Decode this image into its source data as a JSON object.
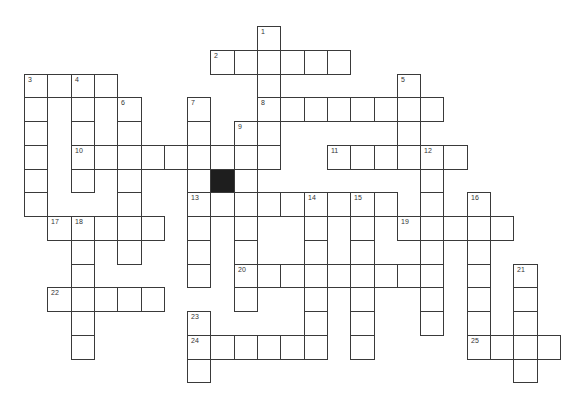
{
  "puzzle": {
    "grid": {
      "origin_x": 24,
      "origin_y": 26,
      "pitch_x": 23.3,
      "pitch_y": 23.75,
      "colors": {
        "line": "#3a3a3a",
        "fill": "#ffffff",
        "block": "#1e1e1e"
      }
    },
    "black_cells": [
      {
        "col": 8,
        "row": 6
      }
    ],
    "across": [
      {
        "number": "2",
        "row": 1,
        "col": 8,
        "length": 6
      },
      {
        "number": "3",
        "row": 2,
        "col": 0,
        "length": 4
      },
      {
        "number": "8",
        "row": 3,
        "col": 10,
        "length": 8
      },
      {
        "number": "10",
        "row": 5,
        "col": 2,
        "length": 9
      },
      {
        "number": "11",
        "row": 5,
        "col": 13,
        "length": 6
      },
      {
        "number": "13",
        "row": 7,
        "col": 7,
        "length": 9
      },
      {
        "number": "17",
        "row": 8,
        "col": 1,
        "length": 5
      },
      {
        "number": "19",
        "row": 8,
        "col": 16,
        "length": 5
      },
      {
        "number": "20",
        "row": 10,
        "col": 9,
        "length": 9
      },
      {
        "number": "22",
        "row": 11,
        "col": 1,
        "length": 5
      },
      {
        "number": "24",
        "row": 13,
        "col": 7,
        "length": 6
      },
      {
        "number": "25",
        "row": 13,
        "col": 19,
        "length": 4
      }
    ],
    "down": [
      {
        "number": "1",
        "row": 0,
        "col": 10,
        "length": 6
      },
      {
        "number": "3",
        "row": 2,
        "col": 0,
        "length": 6
      },
      {
        "number": "4",
        "row": 2,
        "col": 2,
        "length": 5
      },
      {
        "number": "5",
        "row": 2,
        "col": 16,
        "length": 4
      },
      {
        "number": "6",
        "row": 3,
        "col": 4,
        "length": 7
      },
      {
        "number": "7",
        "row": 3,
        "col": 7,
        "length": 8
      },
      {
        "number": "9",
        "row": 4,
        "col": 9,
        "length": 8
      },
      {
        "number": "12",
        "row": 5,
        "col": 17,
        "length": 8
      },
      {
        "number": "14",
        "row": 7,
        "col": 12,
        "length": 7
      },
      {
        "number": "15",
        "row": 7,
        "col": 14,
        "length": 7
      },
      {
        "number": "16",
        "row": 7,
        "col": 19,
        "length": 7
      },
      {
        "number": "18",
        "row": 8,
        "col": 2,
        "length": 6
      },
      {
        "number": "21",
        "row": 10,
        "col": 21,
        "length": 5
      },
      {
        "number": "23",
        "row": 12,
        "col": 7,
        "length": 3
      }
    ]
  }
}
